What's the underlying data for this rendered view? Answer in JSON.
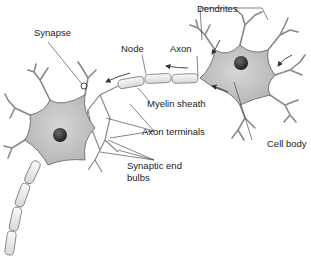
{
  "diagram": {
    "type": "neuron-anatomy",
    "labels": {
      "dendrites": "Dendrites",
      "synapse": "Synapse",
      "node": "Node",
      "axon": "Axon",
      "myelin_sheath": "Myelin sheath",
      "axon_terminals": "Axon terminals",
      "cell_body": "Cell body",
      "synaptic_end_bulbs_line1": "Synaptic end",
      "synaptic_end_bulbs_line2": "bulbs"
    },
    "colors": {
      "cell_fill": "#c8c8c8",
      "nucleus": "#2e2e2e",
      "outline": "#5a5a5a",
      "myelin": "#eeeeee",
      "leader_line": "#333333"
    }
  }
}
